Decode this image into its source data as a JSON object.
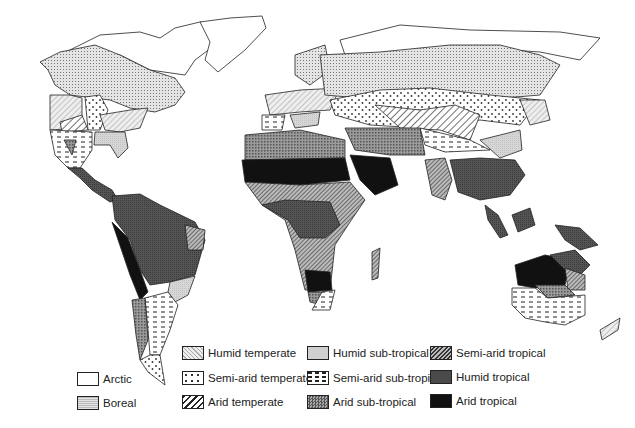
{
  "map": {
    "title": "World climate zones",
    "regions_described": [
      {
        "region": "North America (Canada, Alaska)",
        "zone": "boreal"
      },
      {
        "region": "Arctic coasts, Greenland, northern Siberia",
        "zone": "arctic"
      },
      {
        "region": "Eastern USA",
        "zone": "humid_temperate"
      },
      {
        "region": "South-eastern USA",
        "zone": "humid_subtropical"
      },
      {
        "region": "Great Plains",
        "zone": "semiarid_temperate"
      },
      {
        "region": "US South-west / Mexico",
        "zone": "semiarid_subtropical"
      },
      {
        "region": "Northern Africa / Sahara",
        "zone": "arid_tropical"
      },
      {
        "region": "Arabian Peninsula",
        "zone": "arid_tropical"
      },
      {
        "region": "Sahel / East Africa / Southern Africa",
        "zone": "semiarid_tropical"
      },
      {
        "region": "Central Africa",
        "zone": "humid_tropical"
      },
      {
        "region": "Amazon basin",
        "zone": "humid_tropical"
      },
      {
        "region": "Northern Eurasia",
        "zone": "boreal"
      },
      {
        "region": "Central Asian steppe",
        "zone": "semiarid_temperate"
      },
      {
        "region": "Southeast Asia / Indonesia",
        "zone": "humid_tropical"
      },
      {
        "region": "Central Australia",
        "zone": "arid_tropical"
      },
      {
        "region": "Southern Australia",
        "zone": "semiarid_subtropical"
      }
    ]
  },
  "legend": {
    "items": [
      {
        "key": "arctic",
        "label": "Arctic"
      },
      {
        "key": "boreal",
        "label": "Boreal"
      },
      {
        "key": "humid_temperate",
        "label": "Humid temperate"
      },
      {
        "key": "semiarid_temperate",
        "label": "Semi-arid temperate"
      },
      {
        "key": "arid_temperate",
        "label": "Arid temperate"
      },
      {
        "key": "humid_subtropical",
        "label": "Humid sub-tropical"
      },
      {
        "key": "semiarid_subtropical",
        "label": "Semi-arid sub-tropical"
      },
      {
        "key": "arid_subtropical",
        "label": "Arid sub-tropical"
      },
      {
        "key": "semiarid_tropical",
        "label": "Semi-arid tropical"
      },
      {
        "key": "humid_tropical",
        "label": "Humid tropical"
      },
      {
        "key": "arid_tropical",
        "label": "Arid tropical"
      }
    ]
  },
  "colors": {
    "outline": "#222222",
    "arid_tropical": "#111111",
    "humid_tropical": "#4a4a4a",
    "background": "#ffffff"
  }
}
